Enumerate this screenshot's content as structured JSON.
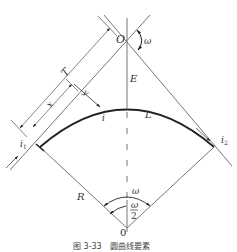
{
  "figure": {
    "caption": "图 3-33　圆曲线要素",
    "labels": {
      "intersection_point": "O",
      "deflection_angle": "ω",
      "external_distance": "E",
      "curve_length": "L",
      "point_on_curve": "i",
      "start_point": "i",
      "start_point_sub": "1",
      "end_point": "i",
      "end_point_sub": "2",
      "radius": "R",
      "center_angle": "ω",
      "half_angle_num": "ω",
      "half_angle_den": "2",
      "center_point": "0",
      "tangent_length": "T",
      "x_coord": "x",
      "y_coord": "y"
    },
    "colors": {
      "line": "#666666",
      "curve": "#222222",
      "text": "#333333",
      "background": "#ffffff"
    }
  }
}
